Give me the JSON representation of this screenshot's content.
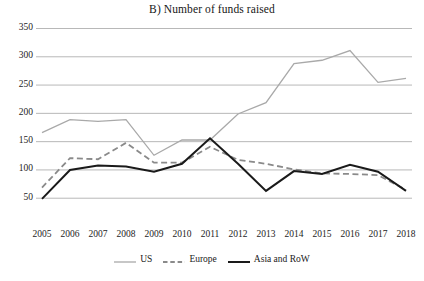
{
  "chart_data": {
    "type": "line",
    "title": "B) Number of funds raised",
    "xlabel": "",
    "ylabel": "",
    "x": [
      2005,
      2006,
      2007,
      2008,
      2009,
      2010,
      2011,
      2012,
      2013,
      2014,
      2015,
      2016,
      2017,
      2018
    ],
    "categories": [
      "2005",
      "2006",
      "2007",
      "2008",
      "2009",
      "2010",
      "2011",
      "2012",
      "2013",
      "2014",
      "2015",
      "2016",
      "2017",
      "2018"
    ],
    "ylim": [
      0,
      350
    ],
    "ytick_values": [
      50,
      100,
      150,
      200,
      250,
      300,
      350
    ],
    "ytick_labels": [
      "50",
      "100",
      "150",
      "200",
      "250",
      "300",
      "350"
    ],
    "grid": true,
    "grid_axis": "y",
    "legend_position": "bottom",
    "series": [
      {
        "name": "US",
        "color": "#a9a9a9",
        "style": "solid",
        "width": 1.3,
        "values": [
          165,
          188,
          185,
          188,
          125,
          152,
          152,
          198,
          218,
          287,
          293,
          310,
          254,
          261
        ]
      },
      {
        "name": "Europe",
        "color": "#8a8a8a",
        "style": "dashed",
        "width": 1.8,
        "values": [
          68,
          120,
          118,
          147,
          112,
          112,
          140,
          117,
          110,
          100,
          93,
          92,
          90,
          64
        ]
      },
      {
        "name": "Asia and RoW",
        "color": "#1a1a1a",
        "style": "solid",
        "width": 2.0,
        "values": [
          48,
          99,
          107,
          105,
          96,
          110,
          155,
          110,
          62,
          97,
          92,
          108,
          96,
          62
        ]
      }
    ]
  },
  "legend": {
    "items": [
      {
        "label": "US",
        "swatch": "solid-line-light-gray"
      },
      {
        "label": "Europe",
        "swatch": "dashed-line-gray"
      },
      {
        "label": "Asia and RoW",
        "swatch": "solid-line-black"
      }
    ]
  },
  "colors": {
    "us_line": "#a9a9a9",
    "europe_line": "#8a8a8a",
    "asia_line": "#1a1a1a",
    "gridline": "#b0b0b0",
    "text": "#1a1a1a",
    "background": "#ffffff"
  }
}
